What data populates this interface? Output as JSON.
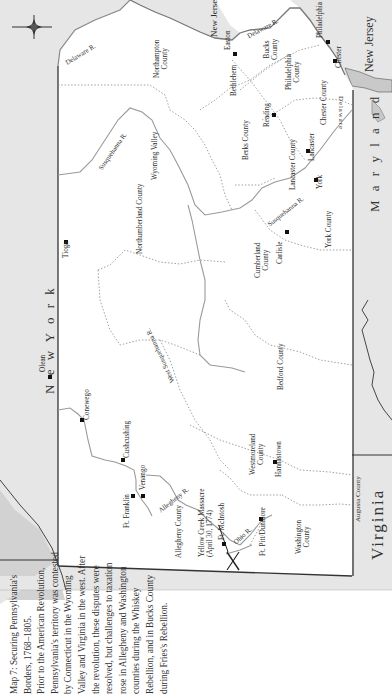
{
  "map": {
    "title": "Map 7: Securing Pennsylvania's Borders, 1768–1805.",
    "orientation": "rotated 90° counter-clockwise",
    "colors": {
      "paper": "#ffffff",
      "neighbor_states": "#e6e6e6",
      "water": "#c9c9c9",
      "border": "#333333",
      "river": "#9a9a9a",
      "county_line": "#8a8a8a",
      "town_marker": "#111111"
    },
    "states": {
      "new_york": "N e w  Y o r k",
      "new_jersey_top": "New Jersey",
      "new_jersey_right": "New Jersey",
      "maryland": "M a r y l a n d",
      "virginia": "Virginia",
      "augusta_county": "Augusta County",
      "delaware_bay": "Delaware"
    },
    "counties": {
      "northampton": "Northampton\nCounty",
      "bucks": "Bucks\nCounty",
      "philadelphia": "Philadelphia\nCounty",
      "chester": "Chester County",
      "berks": "Berks County",
      "lancaster": "Lancaster County",
      "york": "York County",
      "cumberland": "Cumberland\nCounty",
      "northumberland": "Northumberland County",
      "bedford": "Bedford County",
      "westmoreland": "Westmoreland\nCounty",
      "allegheny": "Allegheny County",
      "washington": "Washington\nCounty"
    },
    "regions": {
      "wyoming_valley": "Wyoming Valley"
    },
    "rivers": {
      "delaware_1": "Delaware R.",
      "delaware_2": "Delaware R.",
      "susquehanna_north": "Susquehanna R.",
      "susquehanna_south": "Susquehanna R.",
      "west_susquehanna": "West Susquehanna R.",
      "allegheny": "Allegheny R.",
      "ohio": "Ohio R."
    },
    "towns": {
      "philadelphia": "Philadelphia",
      "chester": "Chester",
      "easton": "Easton",
      "bethlehem": "Bethlehem",
      "reading": "Reading",
      "lancaster": "Lancaster",
      "york": "York",
      "carlisle": "Carlisle",
      "tioga": "Tioga",
      "olean": "Olean",
      "conewego": "Conewego",
      "cushcushing": "Cushcushing",
      "venango": "Venango",
      "ft_franklin": "Ft. Franklin",
      "hannastown": "Hannastown",
      "ft_mcintosh": "Ft. McIntosh",
      "ft_pitt_dunmore": "Ft. Pitt/Dunmore"
    },
    "events": {
      "yellow_creek": "Yellow Creek Massacre\n(April 30, 1774)"
    },
    "compass": "N"
  },
  "caption": {
    "lines": [
      "Map 7: Securing Pennsylvania's Borders, 1768–1805.",
      "Prior to the American Revolution, Pennsylvania's territory was contested by Connecticut in the Wyoming Valley and Virginia in the west. After the revolution, these disputes were resolved, but challenges to taxation rose in Allegheny and Washington counties during the Whiskey Rebellion, and in Bucks County during Fries's Rebellion."
    ]
  }
}
